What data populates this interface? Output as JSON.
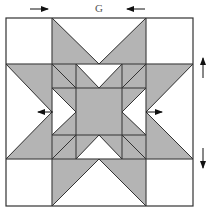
{
  "figure": {
    "dimension_label": "G",
    "colors": {
      "fill": "#b4b4b4",
      "line": "#333333",
      "background": "#ffffff",
      "arrow": "#111111"
    },
    "outer": {
      "x0": 6,
      "y0": 18,
      "x1": 193,
      "y1": 206
    },
    "grid": {
      "xs": [
        6,
        52,
        76,
        99,
        122,
        146,
        193
      ],
      "ys": [
        18,
        64,
        88,
        112,
        135,
        159,
        206
      ]
    },
    "gray_polygons": [
      [
        [
          52,
          18
        ],
        [
          99,
          64
        ],
        [
          52,
          64
        ]
      ],
      [
        [
          146,
          18
        ],
        [
          99,
          64
        ],
        [
          146,
          64
        ]
      ],
      [
        [
          52,
          206
        ],
        [
          99,
          159
        ],
        [
          52,
          159
        ]
      ],
      [
        [
          146,
          206
        ],
        [
          99,
          159
        ],
        [
          146,
          159
        ]
      ],
      [
        [
          6,
          64
        ],
        [
          52,
          112
        ],
        [
          52,
          64
        ]
      ],
      [
        [
          6,
          159
        ],
        [
          52,
          112
        ],
        [
          52,
          159
        ]
      ],
      [
        [
          193,
          64
        ],
        [
          146,
          112
        ],
        [
          146,
          64
        ]
      ],
      [
        [
          193,
          159
        ],
        [
          146,
          112
        ],
        [
          146,
          159
        ]
      ],
      [
        [
          52,
          64
        ],
        [
          76,
          64
        ],
        [
          76,
          88
        ],
        [
          52,
          88
        ]
      ],
      [
        [
          122,
          64
        ],
        [
          146,
          64
        ],
        [
          146,
          88
        ],
        [
          122,
          88
        ]
      ],
      [
        [
          52,
          135
        ],
        [
          76,
          135
        ],
        [
          76,
          159
        ],
        [
          52,
          159
        ]
      ],
      [
        [
          122,
          135
        ],
        [
          146,
          135
        ],
        [
          146,
          159
        ],
        [
          122,
          159
        ]
      ],
      [
        [
          76,
          64
        ],
        [
          99,
          88
        ],
        [
          76,
          88
        ]
      ],
      [
        [
          122,
          64
        ],
        [
          99,
          88
        ],
        [
          122,
          88
        ]
      ],
      [
        [
          76,
          159
        ],
        [
          99,
          135
        ],
        [
          76,
          135
        ]
      ],
      [
        [
          122,
          159
        ],
        [
          99,
          135
        ],
        [
          122,
          135
        ]
      ],
      [
        [
          52,
          88
        ],
        [
          76,
          112
        ],
        [
          76,
          88
        ]
      ],
      [
        [
          52,
          135
        ],
        [
          76,
          112
        ],
        [
          76,
          135
        ]
      ],
      [
        [
          146,
          88
        ],
        [
          122,
          112
        ],
        [
          122,
          88
        ]
      ],
      [
        [
          146,
          135
        ],
        [
          122,
          112
        ],
        [
          122,
          135
        ]
      ],
      [
        [
          76,
          88
        ],
        [
          122,
          88
        ],
        [
          122,
          135
        ],
        [
          76,
          135
        ]
      ]
    ],
    "lines": [
      [
        52,
        18,
        99,
        64
      ],
      [
        146,
        18,
        99,
        64
      ],
      [
        52,
        206,
        99,
        159
      ],
      [
        146,
        206,
        99,
        159
      ],
      [
        6,
        64,
        52,
        112
      ],
      [
        6,
        159,
        52,
        112
      ],
      [
        193,
        64,
        146,
        112
      ],
      [
        193,
        159,
        146,
        112
      ],
      [
        76,
        64,
        99,
        88
      ],
      [
        122,
        64,
        99,
        88
      ],
      [
        76,
        159,
        99,
        135
      ],
      [
        122,
        159,
        99,
        135
      ],
      [
        52,
        88,
        76,
        112
      ],
      [
        52,
        135,
        76,
        112
      ],
      [
        146,
        88,
        122,
        112
      ],
      [
        146,
        135,
        122,
        112
      ],
      [
        52,
        64,
        76,
        88
      ],
      [
        146,
        64,
        122,
        88
      ],
      [
        52,
        159,
        76,
        135
      ],
      [
        146,
        159,
        122,
        135
      ]
    ],
    "arrows": [
      {
        "name": "top-left-arrow",
        "x1": 30,
        "y1": 9,
        "x2": 48,
        "y2": 9
      },
      {
        "name": "top-right-arrow",
        "x1": 145,
        "y1": 9,
        "x2": 127,
        "y2": 9
      },
      {
        "name": "left-arrow",
        "x1": 53,
        "y1": 112,
        "x2": 38,
        "y2": 112
      },
      {
        "name": "right-arrow",
        "x1": 146,
        "y1": 112,
        "x2": 162,
        "y2": 112
      },
      {
        "name": "up-arrow",
        "x1": 203,
        "y1": 78,
        "x2": 203,
        "y2": 58
      },
      {
        "name": "down-arrow",
        "x1": 203,
        "y1": 148,
        "x2": 203,
        "y2": 168
      }
    ]
  }
}
